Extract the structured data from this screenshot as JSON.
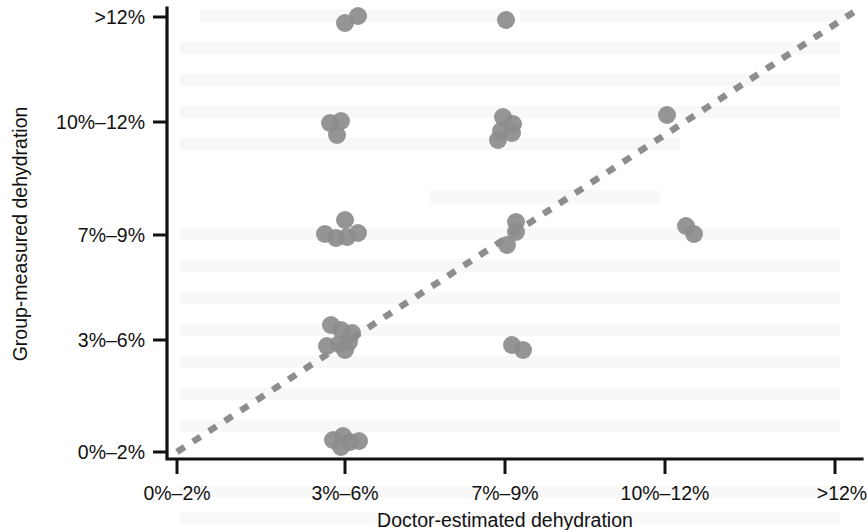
{
  "chart_data": {
    "type": "scatter",
    "title": "",
    "subtitle": "",
    "xlabel": "Doctor-estimated dehydration",
    "ylabel": "Group-measured dehydration",
    "x_categories": [
      "0%–2%",
      "3%–6%",
      "7%–9%",
      "10%–12%",
      ">12%"
    ],
    "y_categories": [
      "0%–2%",
      "3%–6%",
      "7%–9%",
      "10%–12%",
      ">12%"
    ],
    "xlim": [
      0,
      4
    ],
    "ylim": [
      0,
      4
    ],
    "grid": false,
    "legend": null,
    "annotations": [
      {
        "name": "line-of-identity",
        "type": "reference-line",
        "style": "dashed",
        "color": "#8d8d8d",
        "from": [
          0,
          0
        ],
        "to": [
          4,
          4
        ],
        "label": ""
      }
    ],
    "marker": {
      "shape": "circle",
      "color": "#8c8c8c",
      "radius_px": 9,
      "opacity": 0.92
    },
    "points": [
      {
        "x_category": "3%–6%",
        "y_category": ">12%",
        "px": 345,
        "py": 23
      },
      {
        "x_category": "3%–6%",
        "y_category": ">12%",
        "px": 358,
        "py": 16
      },
      {
        "x_category": "3%–6%",
        "y_category": "10%–12%",
        "px": 330,
        "py": 123
      },
      {
        "x_category": "3%–6%",
        "y_category": "10%–12%",
        "px": 341,
        "py": 121
      },
      {
        "x_category": "3%–6%",
        "y_category": "10%–12%",
        "px": 337,
        "py": 135
      },
      {
        "x_category": "3%–6%",
        "y_category": "7%–9%",
        "px": 345,
        "py": 220
      },
      {
        "x_category": "3%–6%",
        "y_category": "7%–9%",
        "px": 358,
        "py": 233
      },
      {
        "x_category": "3%–6%",
        "y_category": "7%–9%",
        "px": 325,
        "py": 234
      },
      {
        "x_category": "3%–6%",
        "y_category": "7%–9%",
        "px": 336,
        "py": 238
      },
      {
        "x_category": "3%–6%",
        "y_category": "7%–9%",
        "px": 347,
        "py": 237
      },
      {
        "x_category": "3%–6%",
        "y_category": "3%–6%",
        "px": 331,
        "py": 325
      },
      {
        "x_category": "3%–6%",
        "y_category": "3%–6%",
        "px": 341,
        "py": 330
      },
      {
        "x_category": "3%–6%",
        "y_category": "3%–6%",
        "px": 327,
        "py": 346
      },
      {
        "x_category": "3%–6%",
        "y_category": "3%–6%",
        "px": 339,
        "py": 344
      },
      {
        "x_category": "3%–6%",
        "y_category": "3%–6%",
        "px": 349,
        "py": 342
      },
      {
        "x_category": "3%–6%",
        "y_category": "3%–6%",
        "px": 352,
        "py": 333
      },
      {
        "x_category": "3%–6%",
        "y_category": "3%–6%",
        "px": 345,
        "py": 350
      },
      {
        "x_category": "3%–6%",
        "y_category": "0%–2%",
        "px": 333,
        "py": 440
      },
      {
        "x_category": "3%–6%",
        "y_category": "0%–2%",
        "px": 343,
        "py": 436
      },
      {
        "x_category": "3%–6%",
        "y_category": "0%–2%",
        "px": 350,
        "py": 442
      },
      {
        "x_category": "3%–6%",
        "y_category": "0%–2%",
        "px": 359,
        "py": 441
      },
      {
        "x_category": "3%–6%",
        "y_category": "0%–2%",
        "px": 341,
        "py": 447
      },
      {
        "x_category": "7%–9%",
        "y_category": ">12%",
        "px": 506,
        "py": 20
      },
      {
        "x_category": "7%–9%",
        "y_category": "10%–12%",
        "px": 503,
        "py": 117
      },
      {
        "x_category": "7%–9%",
        "y_category": "10%–12%",
        "px": 513,
        "py": 124
      },
      {
        "x_category": "7%–9%",
        "y_category": "10%–12%",
        "px": 501,
        "py": 131
      },
      {
        "x_category": "7%–9%",
        "y_category": "10%–12%",
        "px": 512,
        "py": 133
      },
      {
        "x_category": "7%–9%",
        "y_category": "10%–12%",
        "px": 498,
        "py": 140
      },
      {
        "x_category": "7%–9%",
        "y_category": "7%–9%",
        "px": 516,
        "py": 222
      },
      {
        "x_category": "7%–9%",
        "y_category": "7%–9%",
        "px": 516,
        "py": 232
      },
      {
        "x_category": "7%–9%",
        "y_category": "7%–9%",
        "px": 507,
        "py": 245
      },
      {
        "x_category": "7%–9%",
        "y_category": "3%–6%",
        "px": 512,
        "py": 345
      },
      {
        "x_category": "7%–9%",
        "y_category": "3%–6%",
        "px": 523,
        "py": 350
      },
      {
        "x_category": "10%–12%",
        "y_category": "10%–12%",
        "px": 667,
        "py": 115
      },
      {
        "x_category": "10%–12%",
        "y_category": "7%–9%",
        "px": 686,
        "py": 226
      },
      {
        "x_category": "10%–12%",
        "y_category": "7%–9%",
        "px": 694,
        "py": 234
      }
    ],
    "n_points": 36
  },
  "axes": {
    "x_title": "Doctor-estimated dehydration",
    "y_title": "Group-measured dehydration",
    "x_ticks": [
      {
        "label": "0%–2%",
        "px": 177
      },
      {
        "label": "3%–6%",
        "px": 345
      },
      {
        "label": "7%–9%",
        "px": 505
      },
      {
        "label": "10%–12%",
        "px": 665
      },
      {
        "label": ">12%",
        "px": 835
      }
    ],
    "y_ticks": [
      {
        "label": ">12%",
        "py": 17
      },
      {
        "label": "10%–12%",
        "py": 122
      },
      {
        "label": "7%–9%",
        "py": 235
      },
      {
        "label": "3%–6%",
        "py": 340
      },
      {
        "label": "0%–2%",
        "py": 452
      }
    ]
  },
  "colors": {
    "marker": "#8c8c8c",
    "reference_line": "#8d8d8d",
    "axis": "#121212",
    "text": "#111111",
    "background": "#ffffff"
  }
}
